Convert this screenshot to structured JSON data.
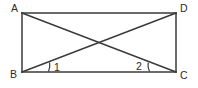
{
  "figure": {
    "type": "geometry-diagram",
    "shape": "rectangle-with-diagonals",
    "canvas": {
      "width": 198,
      "height": 88,
      "background": "#ffffff"
    },
    "stroke_color": "#3a3a3a",
    "text_color": "#2b2b2b",
    "vertices": [
      {
        "name": "A",
        "label": "A",
        "x": 22,
        "y": 13,
        "label_x": 11,
        "label_y": 12
      },
      {
        "name": "D",
        "label": "D",
        "x": 176,
        "y": 13,
        "label_x": 180,
        "label_y": 12
      },
      {
        "name": "B",
        "label": "B",
        "x": 22,
        "y": 72,
        "label_x": 10,
        "label_y": 78
      },
      {
        "name": "C",
        "label": "C",
        "x": 176,
        "y": 72,
        "label_x": 180,
        "label_y": 79
      }
    ],
    "sides": [
      {
        "name": "side-AD",
        "from": "A",
        "to": "D"
      },
      {
        "name": "side-DC",
        "from": "D",
        "to": "C"
      },
      {
        "name": "side-CB",
        "from": "C",
        "to": "B"
      },
      {
        "name": "side-BA",
        "from": "B",
        "to": "A"
      }
    ],
    "diagonals": [
      {
        "name": "diagonal-AC",
        "from": "A",
        "to": "C"
      },
      {
        "name": "diagonal-BD",
        "from": "B",
        "to": "D"
      }
    ],
    "intersection": {
      "name": "diagonal-intersection",
      "x": 99,
      "y": 42.5
    },
    "angles": [
      {
        "name": "angle-1",
        "label": "1",
        "at_vertex": "B",
        "label_x": 54,
        "label_y": 71,
        "arc_path": "M 48.5 71.5 Q 50.4 67.5 49.6 62.5"
      },
      {
        "name": "angle-2",
        "label": "2",
        "at_vertex": "C",
        "label_x": 136,
        "label_y": 70,
        "arc_path": "M 149.5 71.5 Q 147.3 67.3 148.2 62.6"
      }
    ]
  }
}
